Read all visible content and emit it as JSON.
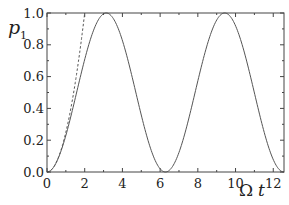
{
  "chart_data": {
    "type": "line",
    "title": "",
    "xlabel": "Ω t",
    "ylabel": "p₁",
    "ylabel_main": "p",
    "ylabel_sub": "1",
    "xlabel_main": "Ω",
    "xlabel_var": "t",
    "xlim": [
      0,
      12.57
    ],
    "ylim": [
      0,
      1.0
    ],
    "grid": false,
    "legend": null,
    "x_ticks": [
      0,
      2,
      4,
      6,
      8,
      10,
      12
    ],
    "x_tick_labels": [
      "0",
      "2",
      "4",
      "6",
      "8",
      "10",
      "12"
    ],
    "y_ticks": [
      0.0,
      0.2,
      0.4,
      0.6,
      0.8,
      1.0
    ],
    "y_tick_labels": [
      "0.0",
      "0.2",
      "0.4",
      "0.6",
      "0.8",
      "1.0"
    ],
    "series": [
      {
        "name": "exact p1 = sin^2(Ωt/2)",
        "style": "solid",
        "color": "#555555",
        "x": [
          0,
          0.5,
          1.0,
          1.5,
          2.0,
          2.5,
          3.14,
          3.5,
          4.0,
          4.5,
          5.0,
          5.5,
          6.0,
          6.28,
          7.0,
          7.5,
          8.0,
          8.5,
          9.0,
          9.42,
          10.0,
          10.5,
          11.0,
          11.5,
          12.0,
          12.57
        ],
        "y": [
          0,
          0.061,
          0.23,
          0.466,
          0.708,
          0.9,
          1.0,
          0.968,
          0.826,
          0.605,
          0.36,
          0.146,
          0.02,
          0.0,
          0.124,
          0.335,
          0.573,
          0.79,
          0.949,
          1.0,
          0.92,
          0.746,
          0.51,
          0.27,
          0.08,
          0.0
        ]
      },
      {
        "name": "short-time approximation (Ωt/2)^2",
        "style": "dashed",
        "color": "#555555",
        "x": [
          0,
          0.5,
          1.0,
          1.5,
          2.0
        ],
        "y": [
          0,
          0.0625,
          0.25,
          0.5625,
          1.0
        ]
      }
    ]
  }
}
